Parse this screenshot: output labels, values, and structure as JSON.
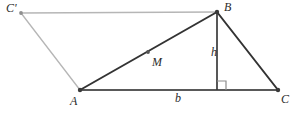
{
  "figure": {
    "type": "geometry-diagram",
    "canvas": {
      "width": 294,
      "height": 118,
      "background": "#ffffff"
    },
    "colors": {
      "primary_stroke": "#333333",
      "base_stroke": "#555555",
      "auxiliary_stroke": "#b6b6b6",
      "point_fill": "#444444",
      "auxiliary_point_fill": "#9a9a9a",
      "label_color": "#2b2b2b"
    },
    "points": [
      {
        "id": "Cprime",
        "label": "C'",
        "x": 21,
        "y": 13,
        "style": "auxiliary"
      },
      {
        "id": "B",
        "label": "B",
        "x": 217,
        "y": 12,
        "style": "primary"
      },
      {
        "id": "A",
        "label": "A",
        "x": 80,
        "y": 90,
        "style": "primary"
      },
      {
        "id": "C",
        "label": "C",
        "x": 278,
        "y": 90,
        "style": "primary"
      },
      {
        "id": "M",
        "label": "M",
        "x": 148,
        "y": 52,
        "style": "primary"
      },
      {
        "id": "H",
        "label": "",
        "x": 217,
        "y": 90,
        "style": "none"
      }
    ],
    "segments": [
      {
        "id": "seg-cprime-b",
        "from": "Cprime",
        "to": "B",
        "style": "auxiliary"
      },
      {
        "id": "seg-cprime-a",
        "from": "Cprime",
        "to": "A",
        "style": "auxiliary"
      },
      {
        "id": "seg-a-b",
        "from": "A",
        "to": "B",
        "style": "primary"
      },
      {
        "id": "seg-b-c",
        "from": "B",
        "to": "C",
        "style": "primary"
      },
      {
        "id": "seg-a-c",
        "from": "A",
        "to": "C",
        "style": "base"
      },
      {
        "id": "seg-b-h",
        "from": "B",
        "to": "H",
        "style": "primary"
      }
    ],
    "measures": [
      {
        "id": "height",
        "label": "h",
        "segment": "seg-b-h",
        "x": 211,
        "y": 46
      },
      {
        "id": "base-side",
        "label": "b",
        "segment": "seg-a-c",
        "x": 175,
        "y": 92
      }
    ],
    "markers": [
      {
        "id": "right-angle",
        "type": "right-angle-square",
        "at": "H",
        "x": 217,
        "y": 90,
        "size": 8
      }
    ],
    "labels": {
      "cprime": "C'",
      "b_vertex": "B",
      "a_vertex": "A",
      "c_vertex": "C",
      "m_point": "M",
      "height": "h",
      "base": "b"
    }
  }
}
